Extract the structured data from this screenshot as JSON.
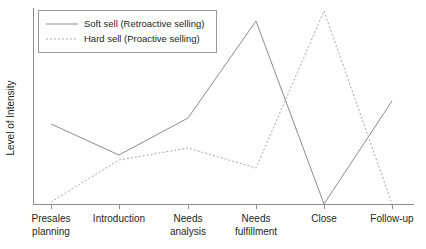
{
  "chart_data": {
    "type": "line",
    "title": "",
    "xlabel": "",
    "ylabel": "Level of Intensity",
    "grid": false,
    "legend_position": "top-left",
    "categories": [
      "Presales planning",
      "Introduction",
      "Needs analysis",
      "Needs fulfillment",
      "Close",
      "Follow-up"
    ],
    "category_lines": [
      [
        "Presales",
        "planning"
      ],
      [
        "Introduction",
        ""
      ],
      [
        "Needs",
        "analysis"
      ],
      [
        "Needs",
        "fulfillment"
      ],
      [
        "Close",
        ""
      ],
      [
        "Follow-up",
        ""
      ]
    ],
    "ylim": [
      0,
      100
    ],
    "y_axis_ticks_shown": false,
    "series": [
      {
        "name": "Soft sell (Retroactive selling)",
        "style": "solid",
        "color": "#8d8d8d",
        "values": [
          44,
          27,
          48,
          100,
          0,
          57
        ]
      },
      {
        "name": "Hard sell (Proactive selling)",
        "style": "dotted",
        "color": "#a9a9a9",
        "values": [
          1,
          24,
          31,
          20,
          106,
          0
        ]
      }
    ],
    "legend_entries": [
      "Soft sell (Retroactive selling)",
      "Hard sell (Proactive selling)"
    ]
  },
  "geometry": {
    "plot_left": 33,
    "plot_right": 414,
    "plot_top": 8,
    "plot_bottom": 204,
    "tick_x": [
      51,
      119,
      188,
      256,
      324,
      392
    ],
    "solid_points_px": "51,124 119,155 188,118 256,21 324,204 392,101",
    "dotted_points_px": "51,202 119,160 188,148 256,168 324,11 392,204",
    "legend_box": {
      "x": 38,
      "y": 10,
      "w": 178,
      "h": 42
    },
    "legend_sample_x1": 46,
    "legend_sample_x2": 78,
    "legend_row1_y": 24,
    "legend_row2_y": 39,
    "ylabel_x": 14,
    "ylabel_y": 118,
    "tick_label_row1_y": 222,
    "tick_label_row2_y": 235
  }
}
